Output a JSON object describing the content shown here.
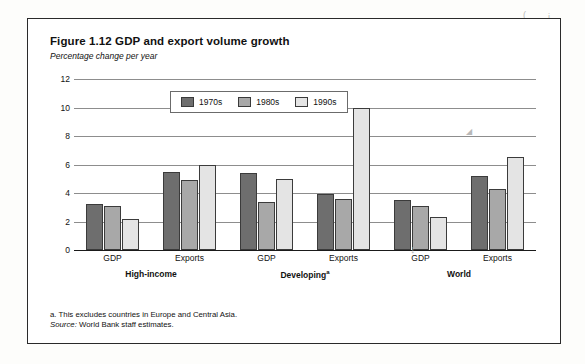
{
  "figure": {
    "title": "Figure 1.12  GDP and export volume growth",
    "subtitle": "Percentage change per year",
    "note_a": "a. This excludes countries in Europe and Central Asia.",
    "source_label": "Source:",
    "source_text": " World Bank staff estimates."
  },
  "legend": {
    "items": [
      {
        "label": "1970s",
        "color": "#6e6e6e"
      },
      {
        "label": "1980s",
        "color": "#a8a8a8"
      },
      {
        "label": "1990s",
        "color": "#e4e4e4"
      }
    ]
  },
  "artifacts": {
    "top_right_1": "(",
    "top_right_2": "i",
    "mid_right": "◢",
    "mid_bottom": "↓"
  },
  "chart_data": {
    "type": "bar",
    "title": "Figure 1.12  GDP and export volume growth",
    "subtitle": "Percentage change per year",
    "xlabel": "",
    "ylabel": "Percentage change per year",
    "ylim": [
      0,
      12
    ],
    "yticks": [
      0,
      2,
      4,
      6,
      8,
      10,
      12
    ],
    "ytick_labels": [
      "0",
      "2",
      "4",
      "6",
      "8",
      "10",
      "12"
    ],
    "grid": true,
    "legend_position": "top-left-inside",
    "categories": [
      "GDP",
      "Exports",
      "GDP",
      "Exports",
      "GDP",
      "Exports"
    ],
    "groups": [
      {
        "region": "High-income",
        "region_footnote": "",
        "categories": [
          "GDP",
          "Exports"
        ]
      },
      {
        "region": "Developing",
        "region_footnote": "a",
        "categories": [
          "GDP",
          "Exports"
        ]
      },
      {
        "region": "World",
        "region_footnote": "",
        "categories": [
          "GDP",
          "Exports"
        ]
      }
    ],
    "series": [
      {
        "name": "1970s",
        "color": "#6e6e6e",
        "values": [
          3.2,
          5.5,
          5.4,
          3.9,
          3.5,
          5.2
        ]
      },
      {
        "name": "1980s",
        "color": "#a8a8a8",
        "values": [
          3.1,
          4.9,
          3.4,
          3.6,
          3.1,
          4.3
        ]
      },
      {
        "name": "1990s",
        "color": "#e4e4e4",
        "values": [
          2.2,
          6.0,
          5.0,
          10.0,
          2.3,
          6.5
        ]
      }
    ]
  }
}
